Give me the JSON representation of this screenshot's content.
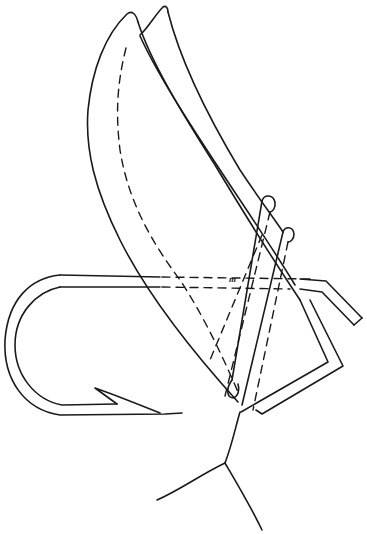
{
  "figure": {
    "label": "m",
    "colors": {
      "stroke": "#1a1a1a",
      "background": "#ffffff"
    },
    "parts": [
      "front-wing",
      "rear-wing",
      "hook-shank",
      "hook-bend",
      "hook-barb",
      "hook-eye-bend",
      "binding-loop-upper",
      "binding-loop-lower",
      "tail-fibers"
    ]
  }
}
